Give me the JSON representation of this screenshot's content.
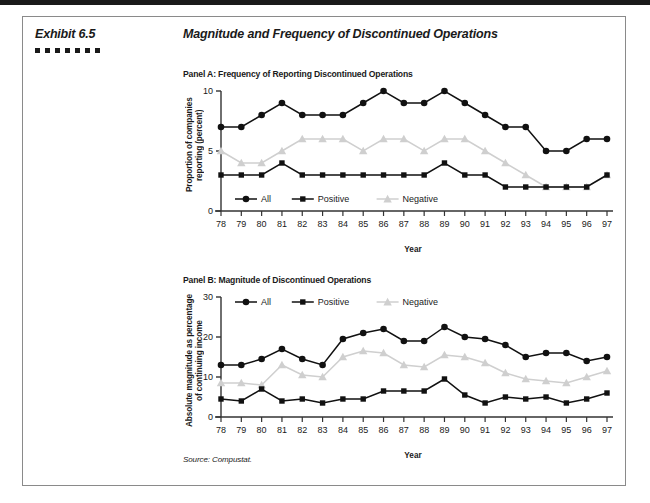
{
  "header": {
    "exhibit_label": "Exhibit 6.5",
    "title": "Magnitude and Frequency of Discontinued Operations",
    "decorative_square_count": 7
  },
  "source_note": "Source: Compustat.",
  "colors": {
    "all": "#111111",
    "positive": "#111111",
    "negative": "#cfcfcf",
    "axis": "#333333",
    "border": "#8a8a8a",
    "topbar": "#1a1a1a"
  },
  "panels": [
    {
      "key": "A",
      "title": "Panel A: Frequency of Reporting Discontinued Operations"
    },
    {
      "key": "B",
      "title": "Panel B: Magnitude of Discontinued Operations"
    }
  ],
  "chart_data": [
    {
      "type": "line",
      "title": "Panel A: Frequency of Reporting Discontinued Operations",
      "xlabel": "Year",
      "ylabel": "Proportion of companies reporting (percent)",
      "x": [
        "78",
        "79",
        "80",
        "81",
        "82",
        "83",
        "84",
        "85",
        "86",
        "87",
        "88",
        "89",
        "90",
        "91",
        "92",
        "93",
        "94",
        "95",
        "96",
        "97"
      ],
      "ylim": [
        0,
        10
      ],
      "yticks": [
        0,
        5,
        10
      ],
      "grid": false,
      "legend_position": "inside-bottom-left",
      "series": [
        {
          "name": "All",
          "marker": "circle",
          "color": "#111111",
          "values": [
            7,
            7,
            8,
            9,
            8,
            8,
            8,
            9,
            10,
            9,
            9,
            10,
            9,
            8,
            7,
            7,
            5,
            5,
            6,
            6
          ]
        },
        {
          "name": "Positive",
          "marker": "square",
          "color": "#111111",
          "values": [
            3,
            3,
            3,
            4,
            3,
            3,
            3,
            3,
            3,
            3,
            3,
            4,
            3,
            3,
            2,
            2,
            2,
            2,
            2,
            3
          ]
        },
        {
          "name": "Negative",
          "marker": "triangle",
          "color": "#cfcfcf",
          "values": [
            5,
            4,
            4,
            5,
            6,
            6,
            6,
            5,
            6,
            6,
            5,
            6,
            6,
            5,
            4,
            3,
            2,
            2,
            2,
            3
          ]
        }
      ]
    },
    {
      "type": "line",
      "title": "Panel B: Magnitude of Discontinued Operations",
      "xlabel": "Year",
      "ylabel": "Absolute magnitude as percentage of continuing income",
      "x": [
        "78",
        "79",
        "80",
        "81",
        "82",
        "83",
        "84",
        "85",
        "86",
        "87",
        "88",
        "89",
        "90",
        "91",
        "92",
        "93",
        "94",
        "95",
        "96",
        "97"
      ],
      "ylim": [
        0,
        30
      ],
      "yticks": [
        0,
        10,
        20,
        30
      ],
      "grid": false,
      "legend_position": "inside-top-left",
      "series": [
        {
          "name": "All",
          "marker": "circle",
          "color": "#111111",
          "values": [
            13,
            13,
            14.5,
            17,
            14.5,
            13,
            19.5,
            21,
            22,
            19,
            19,
            22.5,
            20,
            19.5,
            18,
            15,
            16,
            16,
            14,
            15
          ]
        },
        {
          "name": "Positive",
          "marker": "square",
          "color": "#111111",
          "values": [
            4.5,
            4,
            7,
            4,
            4.5,
            3.5,
            4.5,
            4.5,
            6.5,
            6.5,
            6.5,
            9.5,
            5.5,
            3.5,
            5,
            4.5,
            5,
            3.5,
            4.5,
            6
          ]
        },
        {
          "name": "Negative",
          "marker": "triangle",
          "color": "#cfcfcf",
          "values": [
            8.5,
            8.5,
            8,
            13,
            10.5,
            10,
            15,
            16.5,
            16,
            13,
            12.5,
            15.5,
            15,
            13.5,
            11,
            9.5,
            9,
            8.5,
            10,
            11.5
          ]
        }
      ]
    }
  ]
}
